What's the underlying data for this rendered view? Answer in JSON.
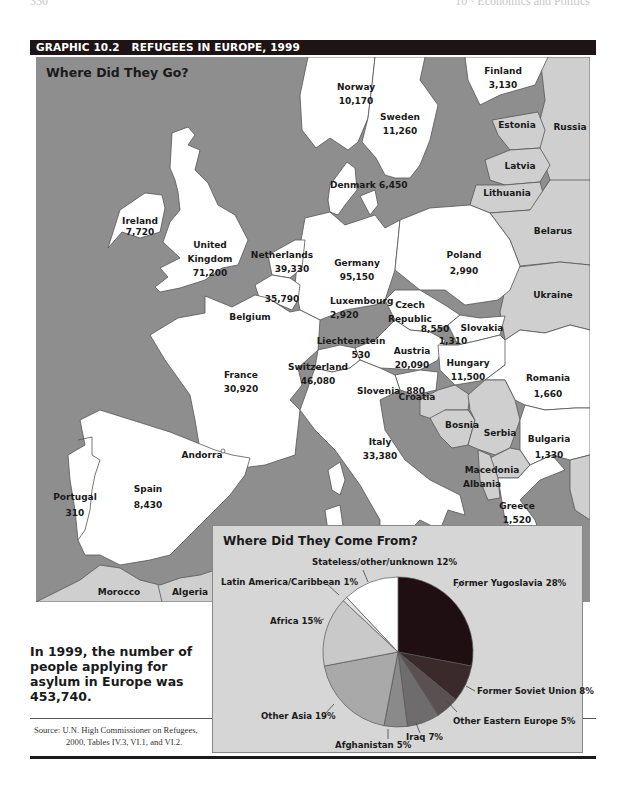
{
  "running_head": {
    "page": "330",
    "section": "10 · Economics and Politics"
  },
  "header": {
    "graphic_number": "GRAPHIC 10.2",
    "title": "REFUGEES IN EUROPE, 1999"
  },
  "map": {
    "heading": "Where Did They Go?",
    "colors": {
      "sea": "#8e8e8e",
      "destination": "#ffffff",
      "other_land": "#cfcfcf",
      "border": "#555555"
    },
    "countries": [
      {
        "name": "Norway",
        "value": "10,170"
      },
      {
        "name": "Sweden",
        "value": "11,260"
      },
      {
        "name": "Finland",
        "value": "3,130"
      },
      {
        "name": "Estonia",
        "value": ""
      },
      {
        "name": "Russia",
        "value": ""
      },
      {
        "name": "Latvia",
        "value": ""
      },
      {
        "name": "Lithuania",
        "value": ""
      },
      {
        "name": "Denmark",
        "value": "6,450"
      },
      {
        "name": "Ireland",
        "value": "7,720"
      },
      {
        "name": "United Kingdom",
        "line1": "United",
        "line2": "Kingdom",
        "value": "71,200"
      },
      {
        "name": "Netherlands",
        "value": "39,330"
      },
      {
        "name": "Germany",
        "value": "95,150"
      },
      {
        "name": "Poland",
        "value": "2,990"
      },
      {
        "name": "Belarus",
        "value": ""
      },
      {
        "name": "Belgium",
        "value": "35,790"
      },
      {
        "name": "Luxembourg",
        "value": "2,920"
      },
      {
        "name": "Czech Republic",
        "line1": "Czech",
        "line2": "Republic",
        "value": "8,550"
      },
      {
        "name": "Slovakia",
        "value": "1,310"
      },
      {
        "name": "Ukraine",
        "value": ""
      },
      {
        "name": "Liechtenstein",
        "value": "530"
      },
      {
        "name": "Austria",
        "value": "20,090"
      },
      {
        "name": "Hungary",
        "value": "11,500"
      },
      {
        "name": "France",
        "value": "30,920"
      },
      {
        "name": "Switzerland",
        "value": "46,080"
      },
      {
        "name": "Slovenia",
        "value": "880"
      },
      {
        "name": "Romania",
        "value": "1,660"
      },
      {
        "name": "Croatia",
        "value": ""
      },
      {
        "name": "Bosnia",
        "value": ""
      },
      {
        "name": "Serbia",
        "value": ""
      },
      {
        "name": "Bulgaria",
        "value": "1,330"
      },
      {
        "name": "Italy",
        "value": "33,380"
      },
      {
        "name": "Andorra",
        "value": ""
      },
      {
        "name": "Macedonia",
        "value": ""
      },
      {
        "name": "Albania",
        "value": ""
      },
      {
        "name": "Portugal",
        "value": "310"
      },
      {
        "name": "Spain",
        "value": "8,430"
      },
      {
        "name": "Greece",
        "value": "1,520"
      },
      {
        "name": "Morocco",
        "value": ""
      },
      {
        "name": "Algeria",
        "value": ""
      }
    ]
  },
  "caption": "In 1999, the number of people applying for asylum in Europe was 453,740.",
  "source": {
    "line1": "Source: U.N. High Commissioner on Refugees,",
    "line2": "2000, Tables IV.3, VI.1, and VI.2."
  },
  "chart_data": [
    {
      "type": "table",
      "title": "Where Did They Go?",
      "columns": [
        "Country",
        "Refugees (asylum applications), 1999"
      ],
      "rows": [
        [
          "Norway",
          10170
        ],
        [
          "Sweden",
          11260
        ],
        [
          "Finland",
          3130
        ],
        [
          "Denmark",
          6450
        ],
        [
          "Ireland",
          7720
        ],
        [
          "United Kingdom",
          71200
        ],
        [
          "Netherlands",
          39330
        ],
        [
          "Germany",
          95150
        ],
        [
          "Poland",
          2990
        ],
        [
          "Belgium",
          35790
        ],
        [
          "Luxembourg",
          2920
        ],
        [
          "Czech Republic",
          8550
        ],
        [
          "Slovakia",
          1310
        ],
        [
          "Liechtenstein",
          530
        ],
        [
          "Austria",
          20090
        ],
        [
          "Hungary",
          11500
        ],
        [
          "France",
          30920
        ],
        [
          "Switzerland",
          46080
        ],
        [
          "Slovenia",
          880
        ],
        [
          "Romania",
          1660
        ],
        [
          "Bulgaria",
          1330
        ],
        [
          "Italy",
          33380
        ],
        [
          "Portugal",
          310
        ],
        [
          "Spain",
          8430
        ],
        [
          "Greece",
          1520
        ]
      ],
      "total_label": "In 1999, the number of people applying for asylum in Europe was 453,740.",
      "total": 453740
    },
    {
      "type": "pie",
      "title": "Where Did They Come From?",
      "start_angle": "12 o'clock, clockwise",
      "categories": [
        "Former Yugoslavia",
        "Former Soviet Union",
        "Other Eastern Europe",
        "Iraq",
        "Afghanistan",
        "Other Asia",
        "Africa",
        "Latin America/Caribbean",
        "Stateless/other/unknown"
      ],
      "values": [
        28,
        8,
        5,
        7,
        5,
        19,
        15,
        1,
        12
      ],
      "unit": "%",
      "labels": [
        "Former Yugoslavia 28%",
        "Former Soviet Union 8%",
        "Other Eastern Europe 5%",
        "Iraq 7%",
        "Afghanistan 5%",
        "Other Asia 19%",
        "Africa 15%",
        "Latin America/Caribbean 1%",
        "Stateless/other/unknown 12%"
      ],
      "colors": [
        "#1f0f12",
        "#3a2a2c",
        "#5a5052",
        "#6f6c6d",
        "#8a8a8a",
        "#a9a9a9",
        "#c9c9c9",
        "#e2e2e2",
        "#ffffff"
      ]
    }
  ],
  "pie": {
    "heading": "Where Did They Come From?",
    "labels": {
      "yugoslavia": "Former Yugoslavia 28%",
      "soviet": "Former Soviet Union 8%",
      "eastern": "Other Eastern Europe 5%",
      "iraq": "Iraq 7%",
      "afghanistan": "Afghanistan 5%",
      "other_asia": "Other Asia 19%",
      "africa": "Africa 15%",
      "latin": "Latin America/Caribbean 1%",
      "stateless": "Stateless/other/unknown 12%"
    }
  }
}
